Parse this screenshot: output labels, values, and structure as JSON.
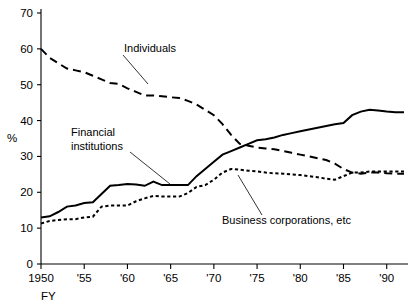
{
  "chart_data": {
    "type": "line",
    "title": "",
    "subtitle": "",
    "xlabel": "FY",
    "ylabel": "%",
    "xlim": [
      1950,
      1992
    ],
    "ylim": [
      0,
      70
    ],
    "ytick_values": [
      0,
      10,
      20,
      30,
      40,
      50,
      60,
      70
    ],
    "ytick_labels": [
      "0",
      "10",
      "20",
      "30",
      "40",
      "50",
      "60",
      "70"
    ],
    "xtick_values": [
      1950,
      1955,
      1960,
      1965,
      1970,
      1975,
      1980,
      1985,
      1990
    ],
    "xtick_labels": [
      "1950",
      "'55",
      "'60",
      "'65",
      "'70",
      "'75",
      "'80",
      "'85",
      "'90"
    ],
    "grid": false,
    "legend_position": "inline-annotations",
    "x": [
      1950,
      1951,
      1952,
      1953,
      1954,
      1955,
      1956,
      1957,
      1958,
      1959,
      1960,
      1961,
      1962,
      1963,
      1964,
      1965,
      1966,
      1967,
      1968,
      1969,
      1970,
      1971,
      1972,
      1973,
      1974,
      1975,
      1976,
      1977,
      1978,
      1979,
      1980,
      1981,
      1982,
      1983,
      1984,
      1985,
      1986,
      1987,
      1988,
      1989,
      1990,
      1991,
      1992
    ],
    "series": [
      {
        "name": "Individuals",
        "style": "long-dashed",
        "values": [
          60.0,
          57.5,
          56.0,
          54.5,
          54.0,
          53.5,
          52.5,
          51.5,
          50.5,
          50.2,
          49.0,
          48.0,
          47.0,
          47.0,
          46.8,
          46.5,
          46.3,
          45.5,
          44.5,
          43.0,
          41.5,
          39.0,
          36.0,
          33.5,
          33.0,
          32.5,
          32.2,
          32.0,
          31.5,
          31.0,
          30.5,
          30.0,
          29.5,
          29.0,
          28.0,
          26.5,
          25.5,
          25.2,
          25.5,
          25.5,
          25.3,
          25.2,
          25.2
        ]
      },
      {
        "name": "Financial institutions",
        "style": "solid",
        "values": [
          13.0,
          13.3,
          14.5,
          16.0,
          16.3,
          17.0,
          17.2,
          19.5,
          21.8,
          22.0,
          22.3,
          22.2,
          21.8,
          23.0,
          22.0,
          22.0,
          22.0,
          22.0,
          24.5,
          26.5,
          28.5,
          30.5,
          31.5,
          32.5,
          33.5,
          34.5,
          34.8,
          35.3,
          36.0,
          36.5,
          37.0,
          37.5,
          38.0,
          38.5,
          39.0,
          39.3,
          41.5,
          42.5,
          43.0,
          42.8,
          42.5,
          42.3,
          42.3
        ]
      },
      {
        "name": "Business corporations, etc",
        "style": "short-dotted",
        "values": [
          11.3,
          12.0,
          12.3,
          12.5,
          12.5,
          13.0,
          13.2,
          16.0,
          16.3,
          16.3,
          16.3,
          17.5,
          18.3,
          19.0,
          18.8,
          18.8,
          18.8,
          19.8,
          21.5,
          22.0,
          23.5,
          25.5,
          26.5,
          26.3,
          26.0,
          25.8,
          25.5,
          25.3,
          25.2,
          25.0,
          24.8,
          24.5,
          24.2,
          23.8,
          23.5,
          24.5,
          25.5,
          25.5,
          25.8,
          25.8,
          25.8,
          25.8,
          25.8
        ]
      }
    ],
    "annotations": [
      {
        "text": "Individuals",
        "label_x": 124,
        "label_y": 52,
        "leader": [
          [
            123,
            55
          ],
          [
            148,
            84
          ]
        ]
      },
      {
        "text_lines": [
          "Financial",
          "institutions"
        ],
        "label_x": 71,
        "label_y": 136,
        "leader": [
          [
            130,
            152
          ],
          [
            170,
            184
          ]
        ]
      },
      {
        "text": "Business corporations, etc",
        "label_x": 222,
        "label_y": 224,
        "leader": [
          [
            262,
            215
          ],
          [
            238,
            175
          ]
        ]
      }
    ]
  },
  "colors": {
    "line": "#000000",
    "axis": "#000000",
    "background": "#ffffff"
  }
}
